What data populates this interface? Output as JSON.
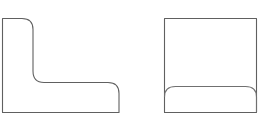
{
  "scene": {
    "name": "two-geometric-line-shapes",
    "background_color": "#ffffff",
    "stroke_color": "#606060",
    "stroke_color_secondary": "#707070",
    "fill_color": "#ffffff",
    "stroke_width": 1.1,
    "width": 265,
    "height": 120
  },
  "shapes": [
    {
      "id": "l-shape",
      "label": "L-shaped bracket outline",
      "kind": "polygon-rounded",
      "bounds": {
        "x": 2,
        "y": 18,
        "width": 117,
        "height": 95
      },
      "corner_radius": 11,
      "vertical_arm_width": 31,
      "horizontal_arm_height": 30,
      "path": "M 2.5 18.5 L 22 18.5 Q 33 18.5 33 29.5 L 33 71 Q 33 82.5 44 82.5 L 108 82.5 Q 119 82.5 119 93.5 L 119 112.5 L 2.5 112.5 Z",
      "corners": [
        {
          "name": "top-left",
          "style": "sharp"
        },
        {
          "name": "arm-top-right",
          "style": "rounded"
        },
        {
          "name": "inner-elbow",
          "style": "rounded"
        },
        {
          "name": "foot-top-right",
          "style": "rounded"
        },
        {
          "name": "bottom-right",
          "style": "sharp"
        },
        {
          "name": "bottom-left",
          "style": "sharp"
        }
      ]
    },
    {
      "id": "rect-shape",
      "label": "Rectangle outline with inner rounded band",
      "kind": "rect-with-inner-curve",
      "bounds": {
        "x": 164,
        "y": 18,
        "width": 93,
        "height": 95
      },
      "outline_path": "M 164.5 18.5 L 256.5 18.5 L 256.5 112.5 L 164.5 112.5 Z",
      "inner_curve": {
        "label": "inner-rounded-band-top",
        "corner_radius": 11,
        "top_y": 86,
        "path": "M 164.5 97 Q 164.5 86.5 175.5 86.5 L 245.5 86.5 Q 256.5 86.5 256.5 97 L 256.5 112.5"
      },
      "corners": [
        {
          "name": "top-left",
          "style": "sharp"
        },
        {
          "name": "top-right",
          "style": "sharp"
        },
        {
          "name": "bottom-right",
          "style": "sharp"
        },
        {
          "name": "bottom-left",
          "style": "sharp"
        }
      ]
    }
  ]
}
